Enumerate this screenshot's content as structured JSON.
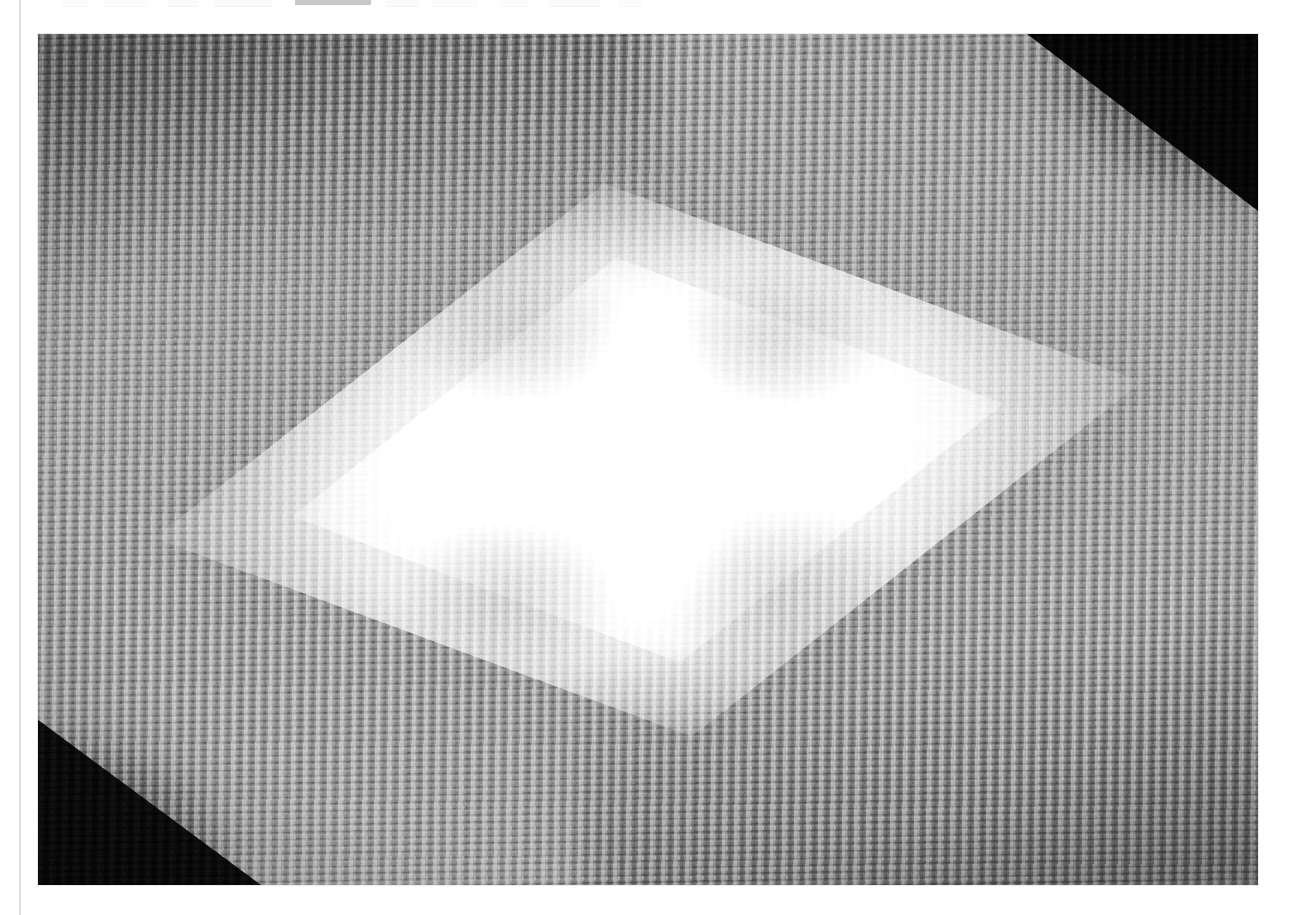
{
  "page": {
    "background_color": "#ffffff",
    "width": 1291,
    "height": 915,
    "margin_rule_color": "#dcdcdc"
  },
  "toolbar": {
    "note": "bottom few pixel rows of a cut-off application toolbar at the very top edge",
    "visible_height_px": 6,
    "selected_item_color": "#c9c9c9",
    "items": [
      {
        "name": "toolbar-item-1",
        "label": "",
        "left": 62,
        "width": 26,
        "state": "faint"
      },
      {
        "name": "toolbar-item-2",
        "label": "",
        "left": 104,
        "width": 44,
        "state": "faint"
      },
      {
        "name": "toolbar-item-3",
        "label": "",
        "left": 168,
        "width": 30,
        "state": "ghost"
      },
      {
        "name": "toolbar-item-4",
        "label": "",
        "left": 214,
        "width": 58,
        "state": "ghost"
      },
      {
        "name": "toolbar-item-selected",
        "label": "",
        "left": 295,
        "width": 76,
        "state": "selected"
      },
      {
        "name": "toolbar-item-5",
        "label": "",
        "left": 386,
        "width": 34,
        "state": "ghost"
      },
      {
        "name": "toolbar-item-6",
        "label": "",
        "left": 432,
        "width": 46,
        "state": "faint"
      },
      {
        "name": "toolbar-item-7",
        "label": "",
        "left": 500,
        "width": 28,
        "state": "faint"
      },
      {
        "name": "toolbar-item-8",
        "label": "",
        "left": 548,
        "width": 52,
        "state": "ghost"
      },
      {
        "name": "toolbar-item-9",
        "label": "",
        "left": 618,
        "width": 24,
        "state": "faint"
      }
    ]
  },
  "photo": {
    "name": "knitted-fabric-photograph",
    "alt": "Grayscale photograph of stockinette-stitch knitted fabric with a large bright diamond of projected light across the centre and dark triangular shadows in the upper-right and lower-left corners",
    "left": 38,
    "top": 34,
    "width": 1220,
    "height": 851,
    "color_mode": "grayscale",
    "subject": "knitted fabric (stockinette stitch)",
    "lighting": "bright rhombus-shaped light patch with a cross-shaped highlight at centre",
    "tones": {
      "highlight": "#ffffff",
      "midtone": "#9a9a9a",
      "base": "#8e8e8e",
      "shadow": "#0d0d0d"
    }
  }
}
